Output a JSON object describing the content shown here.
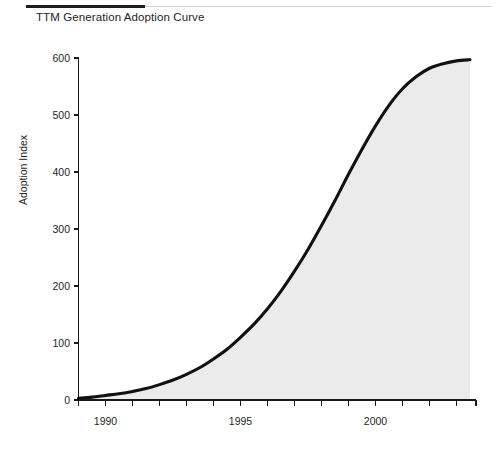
{
  "chart_data": {
    "type": "area",
    "title": "TTM Generation Adoption Curve",
    "xlabel": "",
    "ylabel": "Adoption Index",
    "xlim": [
      1989.0,
      1993.7
    ],
    "ylim": [
      0,
      600
    ],
    "grid": false,
    "legend": "none",
    "fill_color": "#ebebeb",
    "line_color": "#111111",
    "x_tick_labels": [
      "1990",
      "1995",
      "2000"
    ],
    "x_tick_values": [
      1990,
      1995,
      2000
    ],
    "x_minor_tick_values": [
      1989,
      1990,
      1991,
      1992,
      1993,
      1994,
      1995,
      1996,
      1997,
      1998,
      1999,
      2000,
      2001,
      2002,
      2003
    ],
    "y_tick_labels": [
      "0",
      "100",
      "200",
      "300",
      "400",
      "500",
      "600"
    ],
    "y_tick_values": [
      0,
      100,
      200,
      300,
      400,
      500,
      600
    ],
    "x": [
      1989.0,
      1989.5,
      1990.0,
      1990.5,
      1991.0,
      1991.5,
      1992.0,
      1992.5,
      1993.0,
      1993.5,
      1994.0,
      1994.5,
      1995.0,
      1995.5,
      1996.0,
      1996.5,
      1997.0,
      1997.5,
      1998.0,
      1998.5,
      1999.0,
      1999.5,
      2000.0,
      2000.5,
      2001.0,
      2001.5,
      2002.0,
      2002.5,
      2003.0,
      2003.5
    ],
    "values": [
      3,
      5,
      8,
      11,
      15,
      20,
      27,
      35,
      45,
      57,
      72,
      89,
      110,
      133,
      160,
      191,
      226,
      264,
      306,
      350,
      396,
      440,
      481,
      517,
      546,
      567,
      582,
      590,
      595,
      597
    ],
    "series": [
      {
        "name": "Adoption Index",
        "values": [
          3,
          5,
          8,
          11,
          15,
          20,
          27,
          35,
          45,
          57,
          72,
          89,
          110,
          133,
          160,
          191,
          226,
          264,
          306,
          350,
          396,
          440,
          481,
          517,
          546,
          567,
          582,
          590,
          595,
          597
        ]
      }
    ],
    "annotations": {
      "plateau_value": 597,
      "inflection_x": 1999.2,
      "inflection_y": 300
    }
  },
  "header": {
    "title": "TTM Generation Adoption Curve"
  }
}
